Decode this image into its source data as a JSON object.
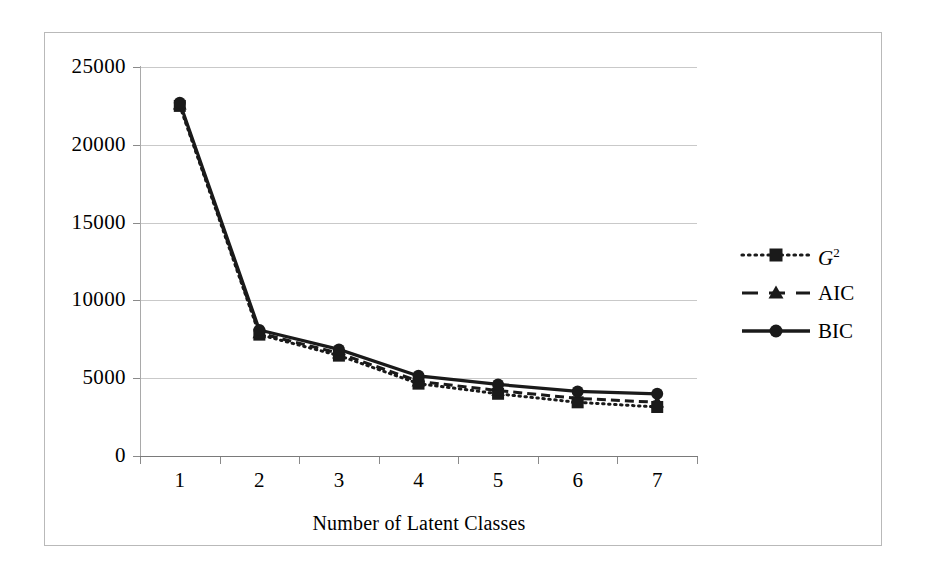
{
  "chart_data": {
    "type": "line",
    "title": "",
    "xlabel": "Number of Latent Classes",
    "ylabel": "",
    "categories": [
      "1",
      "2",
      "3",
      "4",
      "5",
      "6",
      "7"
    ],
    "x": [
      1,
      2,
      3,
      4,
      5,
      6,
      7
    ],
    "ylim": [
      0,
      25000
    ],
    "xlim": [
      0.5,
      7.5
    ],
    "y_ticks": [
      "0",
      "5000",
      "10000",
      "15000",
      "20000",
      "25000"
    ],
    "y_tick_values": [
      0,
      5000,
      10000,
      15000,
      20000,
      25000
    ],
    "grid": "horizontal",
    "legend_position": "right",
    "series": [
      {
        "name": "G2",
        "label": "G",
        "superscript": "2",
        "style": "dotted",
        "marker": "square",
        "color": "#1a1a1a",
        "values": [
          22500,
          7800,
          6450,
          4650,
          4000,
          3450,
          3150
        ]
      },
      {
        "name": "AIC",
        "label": "AIC",
        "superscript": "",
        "style": "dashed",
        "marker": "triangle",
        "color": "#1a1a1a",
        "values": [
          22600,
          7900,
          6600,
          4800,
          4200,
          3700,
          3450
        ]
      },
      {
        "name": "BIC",
        "label": "BIC",
        "superscript": "",
        "style": "solid",
        "marker": "circle",
        "color": "#1a1a1a",
        "values": [
          22700,
          8100,
          6850,
          5150,
          4600,
          4150,
          4000
        ]
      }
    ]
  },
  "colors": {
    "ink": "#1a1a1a",
    "gridline": "#c9c9c9",
    "frame": "#b9b9b9",
    "axis": "#8a8a8a",
    "background": "#ffffff"
  }
}
